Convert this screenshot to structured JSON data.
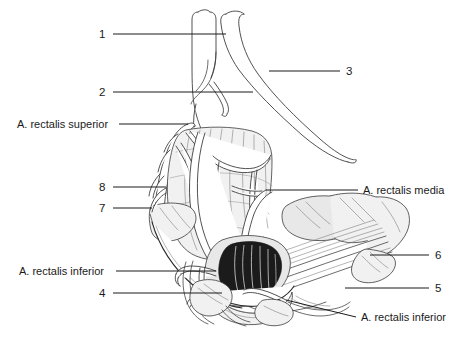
{
  "figure": {
    "background_color": "#ffffff",
    "line_color": "#1a1a1a",
    "width": 458,
    "height": 337
  },
  "labels": {
    "n1": "1",
    "n2": "2",
    "n3": "3",
    "n4": "4",
    "n5": "5",
    "n6": "6",
    "n7": "7",
    "n8": "8",
    "a_rectalis_superior": "A. rectalis superior",
    "a_rectalis_media": "A. rectalis media",
    "a_rectalis_inferior_left": "A. rectalis inferior",
    "a_rectalis_inferior_right": "A. rectalis inferior"
  },
  "callouts": [
    {
      "id": "n1",
      "text": "1",
      "side": "left",
      "text_x": 99,
      "text_y": 38,
      "line_from_x": 113,
      "line_from_y": 34,
      "line_to_x": 226,
      "line_to_y": 34
    },
    {
      "id": "n2",
      "text": "2",
      "side": "left",
      "text_x": 99,
      "text_y": 96,
      "line_from_x": 113,
      "line_from_y": 92,
      "line_to_x": 253,
      "line_to_y": 92
    },
    {
      "id": "a_rectalis_superior",
      "text": "A. rectalis superior",
      "side": "left",
      "text_x": 17,
      "text_y": 128,
      "line_from_x": 119,
      "line_from_y": 124,
      "line_to_x": 188,
      "line_to_y": 124
    },
    {
      "id": "n8",
      "text": "8",
      "side": "left",
      "text_x": 99,
      "text_y": 191,
      "line_from_x": 113,
      "line_from_y": 187,
      "line_to_x": 166,
      "line_to_y": 187
    },
    {
      "id": "n7",
      "text": "7",
      "side": "left",
      "text_x": 99,
      "text_y": 212,
      "line_from_x": 113,
      "line_from_y": 208,
      "line_to_x": 152,
      "line_to_y": 208
    },
    {
      "id": "a_rectalis_inferior_left",
      "text": "A. rectalis inferior",
      "side": "left",
      "text_x": 19,
      "text_y": 275,
      "line_from_x": 116,
      "line_from_y": 271,
      "line_to_x": 216,
      "line_to_y": 271
    },
    {
      "id": "n4",
      "text": "4",
      "side": "left",
      "text_x": 99,
      "text_y": 297,
      "line_from_x": 113,
      "line_from_y": 293,
      "line_to_x": 222,
      "line_to_y": 293
    },
    {
      "id": "n3",
      "text": "3",
      "side": "right",
      "text_x": 346,
      "text_y": 75,
      "line_from_x": 340,
      "line_from_y": 71,
      "line_to_x": 269,
      "line_to_y": 71
    },
    {
      "id": "a_rectalis_media",
      "text": "A. rectalis media",
      "side": "right",
      "text_x": 363,
      "text_y": 194,
      "line_from_x": 358,
      "line_from_y": 190,
      "line_to_x": 266,
      "line_to_y": 190
    },
    {
      "id": "n6",
      "text": "6",
      "side": "right",
      "text_x": 435,
      "text_y": 259,
      "line_from_x": 429,
      "line_from_y": 255,
      "line_to_x": 370,
      "line_to_y": 255
    },
    {
      "id": "n5",
      "text": "5",
      "side": "right",
      "text_x": 435,
      "text_y": 292,
      "line_from_x": 429,
      "line_from_y": 288,
      "line_to_x": 345,
      "line_to_y": 288
    },
    {
      "id": "a_rectalis_inferior_right",
      "text": "A. rectalis inferior",
      "side": "right",
      "text_x": 361,
      "text_y": 321,
      "line_from_x": 356,
      "line_from_y": 317,
      "line_to_x": 286,
      "line_to_y": 300
    }
  ],
  "structures": [
    "superior rectal artery trunk",
    "sigmoid branches",
    "rectal ampulla wall",
    "levator ani muscle",
    "anal canal with anal columns",
    "internal anal sphincter",
    "external anal sphincter",
    "inferior rectal artery branches"
  ]
}
